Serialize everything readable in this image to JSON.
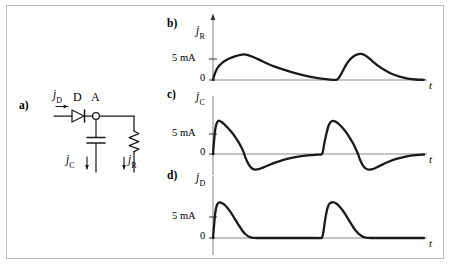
{
  "figure": {
    "panels": [
      {
        "id": "a",
        "letter": "a)"
      },
      {
        "id": "b",
        "letter": "b)"
      },
      {
        "id": "c",
        "letter": "c)"
      },
      {
        "id": "d",
        "letter": "d)"
      }
    ]
  },
  "circuit": {
    "panel_letter": "a)",
    "input_current_label": "j",
    "input_current_sub": "D",
    "diode_letter": "D",
    "node_letter": "A",
    "capacitor_current_label": "j",
    "capacitor_current_sub": "C",
    "resistor_current_label": "j",
    "resistor_current_sub": "R",
    "components": [
      {
        "name": "diode",
        "label": "D"
      },
      {
        "name": "node",
        "label": "A"
      },
      {
        "name": "capacitor",
        "current": "jC"
      },
      {
        "name": "resistor",
        "current": "jR"
      }
    ]
  },
  "chart_data": [
    {
      "type": "line",
      "panel": "b",
      "title": "",
      "ylabel": "j",
      "ylabel_sub": "R",
      "xlabel": "t",
      "ytick_labels": [
        "5 mA",
        "0"
      ],
      "ytick_values": [
        5,
        0
      ],
      "ylim": [
        -1,
        9
      ],
      "xlim": [
        0,
        100
      ],
      "grid": false,
      "legend": null,
      "series": [
        {
          "name": "jR",
          "points": [
            [
              0,
              0
            ],
            [
              1.2,
              1.6
            ],
            [
              3,
              3.0
            ],
            [
              6,
              4.2
            ],
            [
              10,
              5.1
            ],
            [
              14,
              5.7
            ],
            [
              17,
              6.0
            ],
            [
              19,
              6.1
            ],
            [
              21,
              6.0
            ],
            [
              24,
              5.6
            ],
            [
              28,
              4.9
            ],
            [
              33,
              4.0
            ],
            [
              38,
              3.2
            ],
            [
              44,
              2.4
            ],
            [
              50,
              1.7
            ],
            [
              56,
              1.1
            ],
            [
              62,
              0.6
            ],
            [
              68,
              0.25
            ],
            [
              72,
              0.1
            ],
            [
              75,
              0.05
            ],
            [
              76.5,
              0.1
            ],
            [
              78,
              0.8
            ],
            [
              80,
              2.2
            ],
            [
              82,
              3.6
            ],
            [
              84,
              4.7
            ],
            [
              86.5,
              5.6
            ],
            [
              89,
              6.1
            ],
            [
              91,
              6.2
            ],
            [
              93,
              6.0
            ],
            [
              95.5,
              5.4
            ],
            [
              98.5,
              4.4
            ],
            [
              102,
              3.3
            ],
            [
              106,
              2.3
            ],
            [
              110,
              1.5
            ],
            [
              115,
              0.8
            ],
            [
              120,
              0.35
            ],
            [
              125,
              0.12
            ],
            [
              130,
              0.05
            ]
          ]
        }
      ]
    },
    {
      "type": "line",
      "panel": "c",
      "title": "",
      "ylabel": "j",
      "ylabel_sub": "C",
      "xlabel": "t",
      "ytick_labels": [
        "5 mA",
        "0"
      ],
      "ytick_values": [
        5,
        0
      ],
      "ylim": [
        -6,
        10
      ],
      "xlim": [
        0,
        100
      ],
      "grid": false,
      "legend": null,
      "series": [
        {
          "name": "jC",
          "points": [
            [
              0,
              0
            ],
            [
              0.8,
              3.5
            ],
            [
              1.6,
              6.2
            ],
            [
              2.5,
              7.6
            ],
            [
              3.5,
              8.2
            ],
            [
              4.5,
              8.3
            ],
            [
              6,
              8.0
            ],
            [
              8,
              7.4
            ],
            [
              10.5,
              6.5
            ],
            [
              13,
              5.5
            ],
            [
              15.5,
              4.3
            ],
            [
              18,
              2.9
            ],
            [
              20,
              1.6
            ],
            [
              21.5,
              0.4
            ],
            [
              23,
              -1.1
            ],
            [
              25,
              -2.6
            ],
            [
              27,
              -3.5
            ],
            [
              29.5,
              -3.9
            ],
            [
              32,
              -3.8
            ],
            [
              35,
              -3.4
            ],
            [
              39,
              -2.8
            ],
            [
              44,
              -2.1
            ],
            [
              50,
              -1.4
            ],
            [
              56,
              -0.9
            ],
            [
              62,
              -0.55
            ],
            [
              68,
              -0.3
            ],
            [
              73,
              -0.18
            ],
            [
              76,
              -0.12
            ],
            [
              77,
              0.5
            ],
            [
              78,
              2.5
            ],
            [
              79.5,
              5.0
            ],
            [
              81,
              7.0
            ],
            [
              82.5,
              8.0
            ],
            [
              84,
              8.3
            ],
            [
              86,
              8.1
            ],
            [
              88,
              7.6
            ],
            [
              90.5,
              6.7
            ],
            [
              93,
              5.6
            ],
            [
              95.5,
              4.3
            ],
            [
              98,
              2.8
            ],
            [
              100,
              1.4
            ],
            [
              101.5,
              0.2
            ],
            [
              103,
              -1.3
            ],
            [
              105,
              -2.8
            ],
            [
              107,
              -3.6
            ],
            [
              109.5,
              -3.9
            ],
            [
              112,
              -3.8
            ],
            [
              115,
              -3.3
            ],
            [
              119,
              -2.6
            ],
            [
              124,
              -1.8
            ],
            [
              130,
              -1.1
            ],
            [
              136,
              -0.6
            ],
            [
              142,
              -0.3
            ],
            [
              148,
              -0.12
            ]
          ]
        }
      ]
    },
    {
      "type": "line",
      "panel": "d",
      "title": "",
      "ylabel": "j",
      "ylabel_sub": "D",
      "xlabel": "t",
      "ytick_labels": [
        "5 mA",
        "0"
      ],
      "ytick_values": [
        5,
        0
      ],
      "ylim": [
        -1,
        10
      ],
      "xlim": [
        0,
        100
      ],
      "grid": false,
      "legend": null,
      "series": [
        {
          "name": "jD",
          "points": [
            [
              0,
              0
            ],
            [
              0.8,
              3.2
            ],
            [
              1.6,
              6.0
            ],
            [
              2.5,
              7.6
            ],
            [
              3.5,
              8.3
            ],
            [
              4.8,
              8.5
            ],
            [
              6.5,
              8.3
            ],
            [
              8.5,
              7.8
            ],
            [
              10.5,
              7.0
            ],
            [
              12.5,
              6.1
            ],
            [
              14.5,
              5.0
            ],
            [
              16.5,
              3.9
            ],
            [
              18.5,
              2.8
            ],
            [
              20.5,
              1.8
            ],
            [
              22.5,
              1.0
            ],
            [
              24.5,
              0.45
            ],
            [
              26.5,
              0.15
            ],
            [
              28.5,
              0.04
            ],
            [
              31,
              0
            ],
            [
              40,
              0
            ],
            [
              50,
              0
            ],
            [
              60,
              0
            ],
            [
              70,
              0
            ],
            [
              75,
              0
            ],
            [
              76.5,
              0.1
            ],
            [
              77.5,
              1.6
            ],
            [
              78.5,
              4.0
            ],
            [
              79.8,
              6.4
            ],
            [
              81,
              7.8
            ],
            [
              82.5,
              8.4
            ],
            [
              84.5,
              8.5
            ],
            [
              86.5,
              8.2
            ],
            [
              88.5,
              7.6
            ],
            [
              90.5,
              6.8
            ],
            [
              92.5,
              5.8
            ],
            [
              94.5,
              4.7
            ],
            [
              96.5,
              3.6
            ],
            [
              98.5,
              2.5
            ],
            [
              100.5,
              1.6
            ],
            [
              102.5,
              0.9
            ],
            [
              104.5,
              0.4
            ],
            [
              106.5,
              0.13
            ],
            [
              108.5,
              0.03
            ],
            [
              111,
              0
            ],
            [
              120,
              0
            ],
            [
              130,
              0
            ],
            [
              140,
              0
            ],
            [
              148,
              0
            ]
          ]
        }
      ]
    }
  ],
  "colors": {
    "curve": "#1a1a1a",
    "axis": "#8a8a8a",
    "frame": "#b9b9b9",
    "text": "#000000",
    "circuit": "#1a1a1a"
  }
}
